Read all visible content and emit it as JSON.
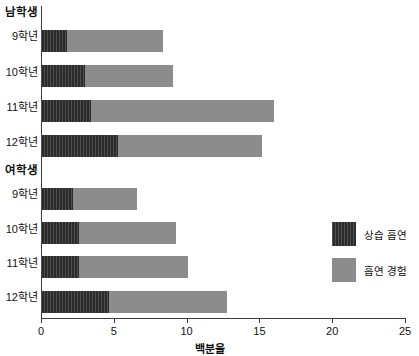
{
  "chart_data": {
    "type": "bar",
    "orientation": "horizontal",
    "stacked": true,
    "title": "",
    "xlabel": "백분율",
    "ylabel": "",
    "xlim": [
      0,
      25
    ],
    "xticks": [
      0,
      5,
      10,
      15,
      20,
      25
    ],
    "xticklabels": [
      "0",
      "5",
      "10",
      "15",
      "20",
      "25"
    ],
    "grid": false,
    "legend_position": "right-inside",
    "legend": [
      {
        "name": "상습 흡연",
        "color": "#2b2b2b"
      },
      {
        "name": "흡연 경험",
        "color": "#8c8c8c"
      }
    ],
    "groups": [
      {
        "label": "남학생",
        "categories": [
          "9학년",
          "10학년",
          "11학년",
          "12학년"
        ],
        "series": [
          {
            "name": "상습 흡연",
            "values": [
              1.8,
              3.0,
              3.4,
              5.3
            ]
          },
          {
            "name": "흡연 경험",
            "values": [
              6.6,
              6.1,
              12.6,
              9.9
            ]
          }
        ],
        "totals": [
          8.4,
          9.1,
          16.0,
          15.2
        ]
      },
      {
        "label": "여학생",
        "categories": [
          "9학년",
          "10학년",
          "11학년",
          "12학년"
        ],
        "series": [
          {
            "name": "상습 흡연",
            "values": [
              2.2,
              2.6,
              2.6,
              4.7
            ]
          },
          {
            "name": "흡연 경험",
            "values": [
              4.4,
              6.7,
              7.5,
              8.1
            ]
          }
        ],
        "totals": [
          6.6,
          9.3,
          10.1,
          12.8
        ]
      }
    ]
  },
  "labels": {
    "group_male": "남학생",
    "group_female": "여학생",
    "grade9": "9학년",
    "grade10": "10학년",
    "grade11": "11학년",
    "grade12": "12학년",
    "xaxis_title": "백분율",
    "legend_habitual": "상습 흡연",
    "legend_experience": "흡연 경험",
    "tick0": "0",
    "tick5": "5",
    "tick10": "10",
    "tick15": "15",
    "tick20": "20",
    "tick25": "25"
  },
  "colors": {
    "habitual": "#2b2b2b",
    "experience": "#8c8c8c",
    "axis": "#3a3a3a",
    "background": "#ffffff"
  }
}
